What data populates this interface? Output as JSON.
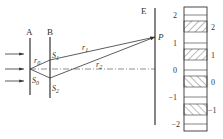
{
  "diagram": {
    "screens": {
      "A": "A",
      "B": "B",
      "E": "E"
    },
    "slits": {
      "S0": "S",
      "S0_sub": "0",
      "S1": "S",
      "S1_sub": "1",
      "S2": "S",
      "S2_sub": "2"
    },
    "paths": {
      "r0": "r",
      "r0_sub": "0",
      "r1": "r",
      "r1_sub": "1",
      "r2": "r",
      "r2_sub": "2"
    },
    "point": "P",
    "fringes": {
      "left_labels": [
        "2",
        "1",
        "0",
        "−1",
        "−2"
      ],
      "right_labels": [
        "2",
        "1",
        "0",
        "−1"
      ]
    }
  },
  "colors": {
    "line": "#333333",
    "hatch": "#999999",
    "background": "#ffffff"
  }
}
